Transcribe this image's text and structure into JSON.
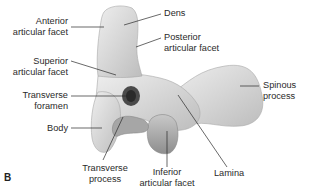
{
  "figure": {
    "panel_letter": "B",
    "labels": {
      "anterior_articular_facet": [
        "Anterior",
        "articular facet"
      ],
      "dens": "Dens",
      "posterior_articular_facet": [
        "Posterior",
        "articular facet"
      ],
      "superior_articular_facet": [
        "Superior",
        "articular facet"
      ],
      "transverse_foramen": [
        "Transverse",
        "foramen"
      ],
      "spinous_process": [
        "Spinous",
        "process"
      ],
      "body": "Body",
      "transverse_process": [
        "Transverse",
        "process"
      ],
      "inferior_articular_facet": [
        "Inferior",
        "articular facet"
      ],
      "lamina": "Lamina"
    }
  }
}
